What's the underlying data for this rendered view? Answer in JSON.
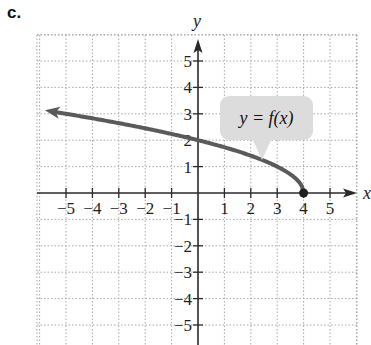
{
  "figure": {
    "label": "c."
  },
  "chart_data": {
    "type": "line",
    "title": "",
    "xlabel": "x",
    "ylabel": "y",
    "xlim": [
      -5.8,
      5.8
    ],
    "ylim": [
      -5.8,
      5.8
    ],
    "grid": true,
    "grid_style": "dotted",
    "x_ticks": [
      -5,
      -4,
      -3,
      -2,
      -1,
      1,
      2,
      3,
      4,
      5
    ],
    "y_ticks": [
      -5,
      -4,
      -3,
      -2,
      -1,
      1,
      2,
      3,
      4,
      5
    ],
    "annotations": [
      {
        "text": "y = f(x)",
        "type": "callout",
        "points_to": [
          2.5,
          1.2
        ]
      }
    ],
    "series": [
      {
        "name": "y = f(x)",
        "function": "sqrt(4 - x)",
        "x": [
          -5.8,
          -5,
          -4,
          -3,
          -2,
          -1,
          0,
          1,
          2,
          3,
          3.5,
          4
        ],
        "y": [
          3.13,
          3,
          2.83,
          2.65,
          2.45,
          2.24,
          2,
          1.73,
          1.41,
          1,
          0.71,
          0
        ],
        "endpoint": {
          "x": 4,
          "y": 0,
          "closed": true
        },
        "left_arrow": true,
        "color": "#5a5a5a"
      }
    ]
  },
  "tick_labels": {
    "x": [
      "−5",
      "−4",
      "−3",
      "−2",
      "−1",
      "1",
      "2",
      "3",
      "4",
      "5"
    ],
    "y_pos": [
      "1",
      "2",
      "3",
      "4",
      "5"
    ],
    "y_neg": [
      "−1",
      "−2",
      "−3",
      "−4",
      "−5"
    ]
  },
  "colors": {
    "axis": "#2a2a2a",
    "grid": "#a8a8a8",
    "curve": "#5a5a5a",
    "bubble": "#dcdcdc"
  }
}
